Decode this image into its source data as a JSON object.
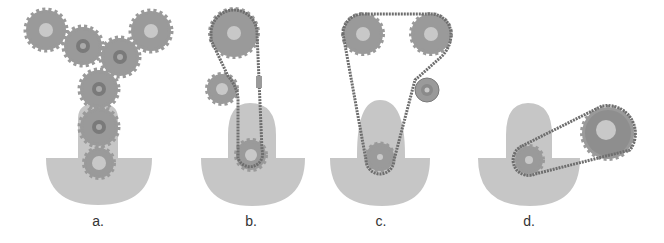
{
  "colors": {
    "body": "#c6c6c6",
    "gear": "#9a9a9a",
    "gear_dark": "#888888",
    "hub_light": "#c8c8c8",
    "hub_dark": "#7a7a7a",
    "chain": "#6e6e6e",
    "tensioner": "#9a9a9a"
  },
  "panels": [
    {
      "id": "a",
      "label": "a.",
      "description": "gear train"
    },
    {
      "id": "b",
      "label": "b.",
      "description": "chain drive with idler and guide"
    },
    {
      "id": "c",
      "label": "c.",
      "description": "twin overhead chain drive with tensioner pulley"
    },
    {
      "id": "d",
      "label": "d.",
      "description": "angled chain drive"
    }
  ]
}
